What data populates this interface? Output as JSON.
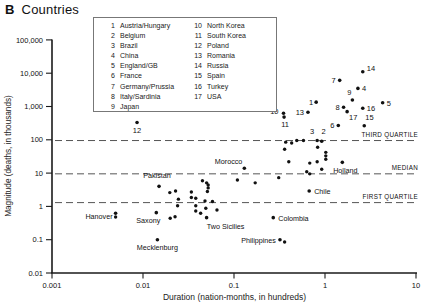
{
  "title": {
    "prefix": "B",
    "text": "Countries"
  },
  "legend": {
    "entries": [
      {
        "num": "1",
        "name": "Austria/Hungary"
      },
      {
        "num": "2",
        "name": "Belgium"
      },
      {
        "num": "3",
        "name": "Brazil"
      },
      {
        "num": "4",
        "name": "China"
      },
      {
        "num": "5",
        "name": "England/GB"
      },
      {
        "num": "6",
        "name": "France"
      },
      {
        "num": "7",
        "name": "Germany/Prussia"
      },
      {
        "num": "8",
        "name": "Italy/Sardinia"
      },
      {
        "num": "9",
        "name": "Japan"
      },
      {
        "num": "10",
        "name": "North Korea"
      },
      {
        "num": "11",
        "name": "South Korea"
      },
      {
        "num": "12",
        "name": "Poland"
      },
      {
        "num": "13",
        "name": "Romania"
      },
      {
        "num": "14",
        "name": "Russia"
      },
      {
        "num": "15",
        "name": "Spain"
      },
      {
        "num": "16",
        "name": "Turkey"
      },
      {
        "num": "17",
        "name": "USA"
      }
    ]
  },
  "chart_data": {
    "type": "scatter",
    "scale": "log-log",
    "xlabel": "Duration (nation-months, in hundreds)",
    "ylabel": "Magnitude (deaths, in thousands)",
    "xlim": [
      0.001,
      10
    ],
    "ylim": [
      0.01,
      100000
    ],
    "grid": false,
    "x_ticks": [
      {
        "v": 0.001,
        "label": "0.001"
      },
      {
        "v": 0.01,
        "label": "0.01"
      },
      {
        "v": 0.1,
        "label": "0.1"
      },
      {
        "v": 1,
        "label": "1"
      },
      {
        "v": 10,
        "label": "10"
      }
    ],
    "y_ticks": [
      {
        "v": 100000,
        "label": "100,000"
      },
      {
        "v": 10000,
        "label": "10,000"
      },
      {
        "v": 1000,
        "label": "1,000"
      },
      {
        "v": 100,
        "label": "100"
      },
      {
        "v": 10,
        "label": "10"
      },
      {
        "v": 1,
        "label": "1"
      },
      {
        "v": 0.1,
        "label": "0.1"
      },
      {
        "v": 0.01,
        "label": "0.01"
      }
    ],
    "reference_lines": [
      {
        "label": "THIRD QUARTILE",
        "value": 95
      },
      {
        "label": "MEDIAN",
        "value": 9.5
      },
      {
        "label": "FIRST QUARTILE",
        "value": 1.3
      }
    ],
    "numbered_points": [
      {
        "n": "1",
        "country": "Austria/Hungary",
        "x": 0.8,
        "y": 1350,
        "anchor": "end",
        "dx": -3,
        "dy": 3
      },
      {
        "n": "2",
        "country": "Belgium",
        "x": 0.92,
        "y": 90,
        "anchor": "middle",
        "dx": 2,
        "dy": -7
      },
      {
        "n": "3",
        "country": "Brazil",
        "x": 0.82,
        "y": 95,
        "anchor": "middle",
        "dx": -5,
        "dy": -7
      },
      {
        "n": "4",
        "country": "China",
        "x": 2.3,
        "y": 3500,
        "anchor": "start",
        "dx": 4,
        "dy": 3
      },
      {
        "n": "5",
        "country": "England/GB",
        "x": 4.3,
        "y": 1300,
        "anchor": "start",
        "dx": 4,
        "dy": 3
      },
      {
        "n": "6",
        "country": "France",
        "x": 1.4,
        "y": 270,
        "anchor": "end",
        "dx": -4,
        "dy": 3
      },
      {
        "n": "7",
        "country": "Germany/Prussia",
        "x": 1.45,
        "y": 6100,
        "anchor": "end",
        "dx": -4,
        "dy": 3
      },
      {
        "n": "8",
        "country": "Italy/Sardinia",
        "x": 1.6,
        "y": 950,
        "anchor": "end",
        "dx": -4,
        "dy": 3
      },
      {
        "n": "9",
        "country": "Japan",
        "x": 2.0,
        "y": 1570,
        "anchor": "middle",
        "dx": -3,
        "dy": -5
      },
      {
        "n": "10",
        "country": "North Korea",
        "x": 0.35,
        "y": 630,
        "anchor": "end",
        "dx": -5,
        "dy": 1
      },
      {
        "n": "11",
        "country": "South Korea",
        "x": 0.355,
        "y": 480,
        "anchor": "middle",
        "dx": 1,
        "dy": 10
      },
      {
        "n": "12",
        "country": "Poland",
        "x": 0.0086,
        "y": 330,
        "anchor": "middle",
        "dx": 0,
        "dy": 10
      },
      {
        "n": "13",
        "country": "Romania",
        "x": 0.65,
        "y": 670,
        "anchor": "end",
        "dx": -4,
        "dy": 3
      },
      {
        "n": "14",
        "country": "Russia",
        "x": 2.6,
        "y": 11000,
        "anchor": "start",
        "dx": 4,
        "dy": -1
      },
      {
        "n": "15",
        "country": "Spain",
        "x": 2.7,
        "y": 265,
        "anchor": "start",
        "dx": 1,
        "dy": -6
      },
      {
        "n": "16",
        "country": "Turkey",
        "x": 2.6,
        "y": 890,
        "anchor": "start",
        "dx": 4,
        "dy": 3
      },
      {
        "n": "17",
        "country": "USA",
        "x": 1.75,
        "y": 700,
        "anchor": "start",
        "dx": 2,
        "dy": 8
      }
    ],
    "named_points": [
      {
        "name": "Morocco",
        "x": 0.13,
        "y": 14,
        "anchor": "end",
        "dx": -2,
        "dy": -4
      },
      {
        "name": "Pakistan",
        "x": 0.015,
        "y": 4,
        "anchor": "middle",
        "dx": -2,
        "dy": -8
      },
      {
        "name": "Holland",
        "x": 1.55,
        "y": 21,
        "anchor": "middle",
        "dx": 3,
        "dy": 11
      },
      {
        "name": "Chile",
        "x": 0.67,
        "y": 2.9,
        "anchor": "start",
        "dx": 5,
        "dy": 3
      },
      {
        "name": "Hanover",
        "x": 0.005,
        "y": 0.62,
        "anchor": "end",
        "dx": -3,
        "dy": 6
      },
      {
        "name": "Saxony",
        "x": 0.014,
        "y": 0.65,
        "anchor": "middle",
        "dx": -8,
        "dy": 10
      },
      {
        "name": "Mecklenburg",
        "x": 0.0144,
        "y": 0.1,
        "anchor": "middle",
        "dx": 0,
        "dy": 10
      },
      {
        "name": "Two Sicilies",
        "x": 0.05,
        "y": 0.46,
        "anchor": "middle",
        "dx": 19,
        "dy": 11
      },
      {
        "name": "Colombia",
        "x": 0.27,
        "y": 0.46,
        "anchor": "start",
        "dx": 5,
        "dy": 3
      },
      {
        "name": "Philippines",
        "x": 0.32,
        "y": 0.1,
        "anchor": "end",
        "dx": -4,
        "dy": 3
      }
    ],
    "unlabeled_points": [
      [
        0.005,
        0.48
      ],
      [
        0.36,
        0.085
      ],
      [
        0.0197,
        2.6
      ],
      [
        0.0228,
        2.9
      ],
      [
        0.034,
        2.7
      ],
      [
        0.052,
        3.6
      ],
      [
        0.0245,
        1.65
      ],
      [
        0.038,
        1.75
      ],
      [
        0.034,
        1.85
      ],
      [
        0.048,
        1.45
      ],
      [
        0.058,
        1.4
      ],
      [
        0.024,
        1.05
      ],
      [
        0.038,
        1.05
      ],
      [
        0.049,
        0.88
      ],
      [
        0.065,
        0.78
      ],
      [
        0.038,
        0.73
      ],
      [
        0.043,
        0.62
      ],
      [
        0.0199,
        0.44
      ],
      [
        0.0225,
        0.49
      ],
      [
        0.045,
        5.9
      ],
      [
        0.05,
        5.1
      ],
      [
        0.052,
        4.4
      ],
      [
        0.051,
        2.8
      ],
      [
        0.109,
        6.2
      ],
      [
        0.171,
        5.1
      ],
      [
        0.31,
        7.3
      ],
      [
        0.4,
        22
      ],
      [
        0.36,
        52
      ],
      [
        0.37,
        85
      ],
      [
        0.43,
        80
      ],
      [
        0.49,
        95
      ],
      [
        0.58,
        95
      ],
      [
        0.63,
        11
      ],
      [
        0.68,
        9.5
      ],
      [
        0.68,
        20
      ],
      [
        0.82,
        22
      ],
      [
        0.92,
        13
      ],
      [
        1.02,
        42
      ],
      [
        1.02,
        33
      ],
      [
        1.02,
        26
      ],
      [
        0.83,
        60
      ]
    ],
    "colors": {
      "point": "#111111",
      "axis": "#1a1a1a",
      "dashed_line": "#555555",
      "text": "#111111"
    }
  }
}
